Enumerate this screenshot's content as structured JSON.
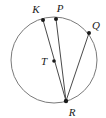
{
  "figure": {
    "type": "circle-geometry-diagram",
    "background_color": "#ffffff",
    "stroke_color": "#6e6e6e",
    "chord_color": "#4a4a4a",
    "point_color": "#1a1a1a",
    "label_color": "#1a1a1a",
    "circle": {
      "name": "circle-T",
      "center_label": "T",
      "cx": 54,
      "cy": 60,
      "r": 43
    },
    "points": [
      {
        "label": "K",
        "x": 43,
        "y": 20,
        "label_x": 36,
        "label_y": 13,
        "on_circle": true
      },
      {
        "label": "P",
        "x": 56,
        "y": 19,
        "label_x": 60,
        "label_y": 12,
        "on_circle": true
      },
      {
        "label": "Q",
        "x": 89,
        "y": 33,
        "label_x": 93,
        "label_y": 28,
        "on_circle": true
      },
      {
        "label": "T",
        "x": 54,
        "y": 61,
        "label_x": 43,
        "label_y": 63,
        "on_circle": false
      },
      {
        "label": "R",
        "x": 66,
        "y": 101,
        "label_x": 70,
        "label_y": 115,
        "on_circle": true
      }
    ],
    "chords": [
      {
        "name": "chord-KR",
        "from": "K",
        "to": "R",
        "x1": 43,
        "y1": 20,
        "x2": 66,
        "y2": 101
      },
      {
        "name": "chord-PR",
        "from": "P",
        "to": "R",
        "x1": 56,
        "y1": 19,
        "x2": 66,
        "y2": 101
      },
      {
        "name": "chord-QR",
        "from": "Q",
        "to": "R",
        "x1": 89,
        "y1": 33,
        "x2": 66,
        "y2": 101
      }
    ],
    "labels": {
      "k": "K",
      "p": "P",
      "q": "Q",
      "t": "T",
      "r": "R"
    }
  }
}
